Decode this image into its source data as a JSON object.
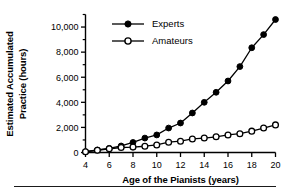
{
  "chart_data": {
    "type": "line",
    "title": "",
    "xlabel": "Age of the Pianists (years)",
    "ylabel_line1": "Estimated Accumulated",
    "ylabel_line2": "Practice (hours)",
    "ylabel": "Estimated Accumulated Practice (hours)",
    "xlim": [
      4,
      20
    ],
    "ylim": [
      0,
      11000
    ],
    "xticks": [
      4,
      6,
      8,
      10,
      12,
      14,
      16,
      18,
      20
    ],
    "xtick_labels": [
      "4",
      "6",
      "8",
      "10",
      "12",
      "14",
      "16",
      "18",
      "20"
    ],
    "yticks": [
      0,
      2000,
      4000,
      6000,
      8000,
      10000
    ],
    "ytick_labels": [
      "0",
      "2,000",
      "4,000",
      "6,000",
      "8,000",
      "10,000"
    ],
    "yminor_ticks": [
      1000,
      3000,
      5000,
      7000,
      9000,
      11000
    ],
    "grid": false,
    "legend_position": "upper-center-left",
    "x": [
      4,
      5,
      6,
      7,
      8,
      9,
      10,
      11,
      12,
      13,
      14,
      15,
      16,
      17,
      18,
      19,
      20
    ],
    "series": [
      {
        "name": "Experts",
        "marker": "filled-circle",
        "color": "#000000",
        "values": [
          60,
          200,
          330,
          520,
          800,
          1150,
          1400,
          1950,
          2350,
          3150,
          4000,
          4800,
          5700,
          6850,
          8350,
          9400,
          10600
        ]
      },
      {
        "name": "Amateurs",
        "marker": "open-circle",
        "color": "#000000",
        "values": [
          60,
          180,
          300,
          400,
          430,
          500,
          600,
          820,
          900,
          1080,
          1150,
          1250,
          1400,
          1500,
          1700,
          1950,
          2200
        ]
      }
    ]
  },
  "legend": {
    "items": [
      {
        "label": "Experts",
        "marker": "filled-circle"
      },
      {
        "label": "Amateurs",
        "marker": "open-circle"
      }
    ]
  },
  "colors": {
    "ink": "#000000",
    "rule": "#1a1a1a",
    "background": "#ffffff"
  }
}
